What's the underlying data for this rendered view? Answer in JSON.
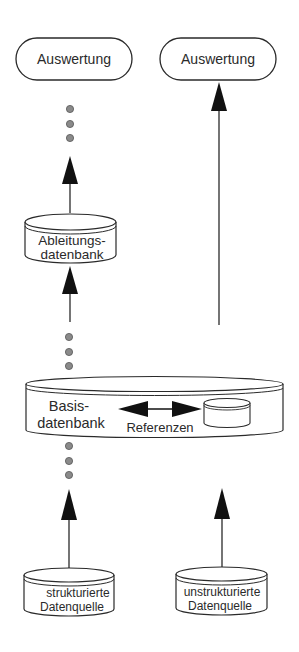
{
  "diagram": {
    "colors": {
      "stroke": "#2a2a2a",
      "dot_fill": "#8a8a8a",
      "background": "#ffffff"
    },
    "outputs": {
      "left": {
        "label": "Auswertung"
      },
      "right": {
        "label": "Auswertung"
      }
    },
    "derived_db": {
      "line1": "Ableitungs-",
      "line2": "datenbank"
    },
    "base_db": {
      "line1": "Basis-",
      "line2": "datenbank",
      "reference_label": "Referenzen"
    },
    "sources": {
      "structured": {
        "line1": "strukturierte",
        "line2": "Datenquelle"
      },
      "unstructured": {
        "line1": "unstrukturierte",
        "line2": "Datenquelle"
      }
    },
    "icons": {
      "ellipsis_dots": "vertical-ellipsis",
      "arrow": "arrow-up",
      "reference_arrow": "double-headed-arrow",
      "database": "cylinder"
    }
  }
}
